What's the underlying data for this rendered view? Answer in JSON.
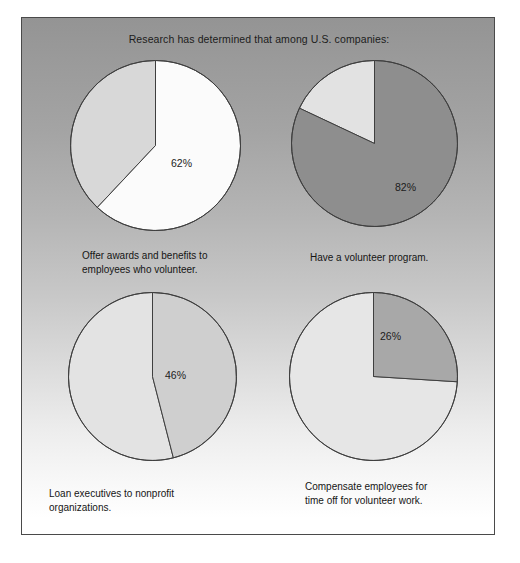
{
  "figure": {
    "title": "Research has determined that among U.S. companies:",
    "background_top_color": "#949494",
    "background_bottom_color": "#ffffff",
    "border_color": "#4a4a4a"
  },
  "charts": [
    {
      "id": "pie-offer-awards",
      "value_label": "62%",
      "caption": "Offer awards and benefits to\nemployees who volunteer.",
      "highlight_percent": 62,
      "highlight_color": "#fbfbfb",
      "remainder_color": "#d8d8d8",
      "outline_color": "#3f3f3f",
      "radius": 85
    },
    {
      "id": "pie-volunteer-program",
      "value_label": "82%",
      "caption": "Have a volunteer program.",
      "highlight_percent": 82,
      "highlight_color": "#8e8e8e",
      "remainder_color": "#e2e2e2",
      "outline_color": "#3f3f3f",
      "radius": 83
    },
    {
      "id": "pie-loan-executives",
      "value_label": "46%",
      "caption": "Loan executives to nonprofit organizations.",
      "highlight_percent": 46,
      "highlight_color": "#cfcfcf",
      "remainder_color": "#e3e3e3",
      "outline_color": "#3f3f3f",
      "radius": 84
    },
    {
      "id": "pie-compensate-employees",
      "value_label": "26%",
      "caption": "Compensate employees for\ntime off for volunteer work.",
      "highlight_percent": 26,
      "highlight_color": "#a8a8a8",
      "remainder_color": "#e6e6e6",
      "outline_color": "#3f3f3f",
      "radius": 84
    }
  ],
  "chart_data": {
    "type": "pie",
    "title": "Research has determined that among U.S. companies:",
    "xlabel": "",
    "ylabel": "",
    "legend": "none",
    "grid": false,
    "note": "Four separate single-highlight pie charts; each shows one percentage of U.S. companies and its complement.",
    "charts": [
      {
        "title": "Offer awards and benefits to employees who volunteer.",
        "labels": [
          "Offer awards and benefits to employees who volunteer",
          "Do not"
        ],
        "values": [
          62,
          38
        ],
        "data_labels": [
          "62%",
          ""
        ],
        "start_angle_deg": 0,
        "direction": "clockwise"
      },
      {
        "title": "Have a volunteer program.",
        "labels": [
          "Have a volunteer program",
          "Do not"
        ],
        "values": [
          82,
          18
        ],
        "data_labels": [
          "82%",
          ""
        ],
        "start_angle_deg": 0,
        "direction": "clockwise"
      },
      {
        "title": "Loan executives to nonprofit organizations.",
        "labels": [
          "Loan executives to nonprofit organizations",
          "Do not"
        ],
        "values": [
          46,
          54
        ],
        "data_labels": [
          "46%",
          ""
        ],
        "start_angle_deg": 0,
        "direction": "clockwise"
      },
      {
        "title": "Compensate employees for time off for volunteer work.",
        "labels": [
          "Compensate employees for time off for volunteer work",
          "Do not"
        ],
        "values": [
          26,
          74
        ],
        "data_labels": [
          "26%",
          ""
        ],
        "start_angle_deg": 0,
        "direction": "clockwise"
      }
    ]
  }
}
